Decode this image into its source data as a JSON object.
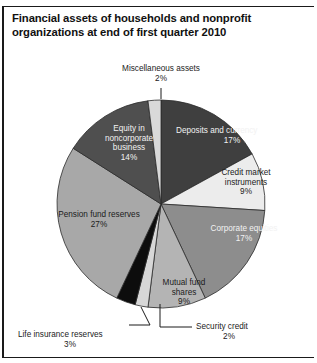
{
  "figure": {
    "title": "Financial assets of households and nonprofit organizations at end of first quarter 2010"
  },
  "chart_data": {
    "type": "pie",
    "title": "Financial assets of households and nonprofit organizations at end of first quarter 2010",
    "unit": "percent of total financial assets",
    "legend": "none (slices labeled directly)",
    "grid": false,
    "start_angle_deg": -90,
    "direction": "clockwise",
    "categories": [
      "Deposits and currency",
      "Credit market instruments",
      "Corporate equities",
      "Mutual fund shares",
      "Security credit",
      "Life insurance reserves",
      "Pension fund reserves",
      "Equity in noncorporate business",
      "Miscellaneous assets"
    ],
    "values": [
      17,
      9,
      17,
      9,
      2,
      3,
      27,
      14,
      2
    ],
    "value_labels": [
      "17%",
      "9%",
      "17%",
      "9%",
      "2%",
      "3%",
      "27%",
      "14%",
      "2%"
    ],
    "colors": [
      "#3f3f3f",
      "#ececec",
      "#8d8d8d",
      "#b4b4b4",
      "#d7d7d7",
      "#0d0d0d",
      "#a8a8a8",
      "#4f4f4f",
      "#d9d9d9"
    ],
    "slices": [
      {
        "label": "Deposits and currency",
        "value": 17,
        "value_label": "17%",
        "color": "#3f3f3f",
        "label_placement": "inside",
        "label_color": "light"
      },
      {
        "label": "Credit market instruments",
        "value": 9,
        "value_label": "9%",
        "color": "#ececec",
        "label_placement": "inside",
        "label_color": "dark"
      },
      {
        "label": "Corporate equities",
        "value": 17,
        "value_label": "17%",
        "color": "#8d8d8d",
        "label_placement": "inside",
        "label_color": "light"
      },
      {
        "label": "Mutual fund shares",
        "value": 9,
        "value_label": "9%",
        "color": "#b4b4b4",
        "label_placement": "inside",
        "label_color": "dark"
      },
      {
        "label": "Security credit",
        "value": 2,
        "value_label": "2%",
        "color": "#d7d7d7",
        "label_placement": "callout",
        "label_color": "dark"
      },
      {
        "label": "Life insurance reserves",
        "value": 3,
        "value_label": "3%",
        "color": "#0d0d0d",
        "label_placement": "callout",
        "label_color": "dark"
      },
      {
        "label": "Pension fund reserves",
        "value": 27,
        "value_label": "27%",
        "color": "#a8a8a8",
        "label_placement": "inside",
        "label_color": "dark"
      },
      {
        "label": "Equity in noncorporate business",
        "value": 14,
        "value_label": "14%",
        "color": "#4f4f4f",
        "label_placement": "inside",
        "label_color": "light"
      },
      {
        "label": "Miscellaneous assets",
        "value": 2,
        "value_label": "2%",
        "color": "#d9d9d9",
        "label_placement": "callout",
        "label_color": "dark"
      }
    ]
  },
  "labels": {
    "misc_assets": {
      "l1": "Miscellaneous assets",
      "l2": "2%"
    },
    "deposits": {
      "l1": "Deposits and currency",
      "l2": "17%"
    },
    "credit_market": {
      "l1": "Credit market",
      "l2": "instruments",
      "l3": "9%"
    },
    "corporate_equities": {
      "l1": "Corporate equities",
      "l2": "17%"
    },
    "mutual_fund": {
      "l1": "Mutual fund",
      "l2": "shares",
      "l3": "9%"
    },
    "security_credit": {
      "l1": "Security credit",
      "l2": "2%"
    },
    "life_insurance": {
      "l1": "Life insurance reserves",
      "l2": "3%"
    },
    "pension_fund": {
      "l1": "Pension fund reserves",
      "l2": "27%"
    },
    "equity_noncorp": {
      "l1": "Equity in",
      "l2": "noncorporate",
      "l3": "business",
      "l4": "14%"
    }
  }
}
